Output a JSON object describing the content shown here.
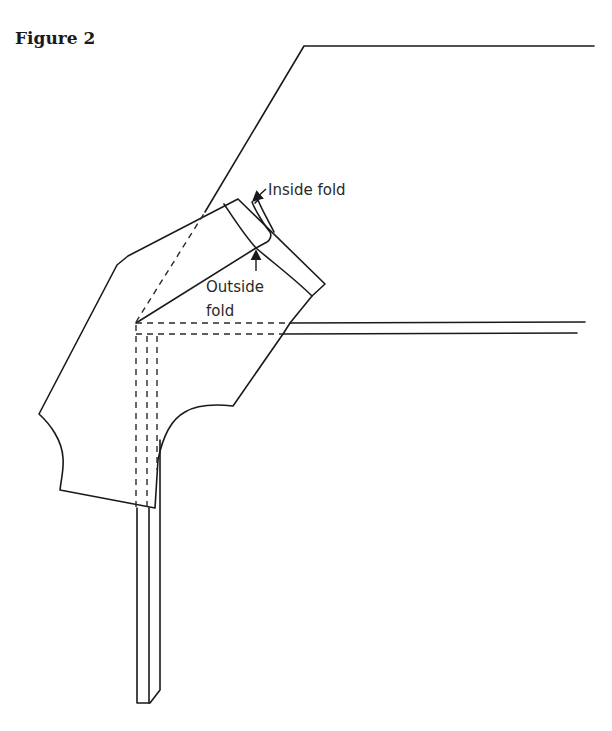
{
  "figure": {
    "title": "Figure 2"
  },
  "labels": {
    "inside_fold": "Inside fold",
    "outside_fold_line1": "Outside",
    "outside_fold_line2": "fold"
  },
  "colors": {
    "line": "#1a1a1a",
    "text": "#2a2a2a",
    "background": "#ffffff"
  }
}
